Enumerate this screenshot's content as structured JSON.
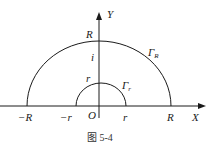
{
  "diagram": {
    "axes": {
      "x_label": "X",
      "y_label": "Y",
      "origin_label": "O"
    },
    "points": {
      "neg_R": "−R",
      "neg_r": "−r",
      "pos_r": "r",
      "pos_R": "R",
      "top_R": "R",
      "top_r": "r",
      "i": "i"
    },
    "curves": {
      "big_arc": "Γ",
      "big_arc_sub": "R",
      "small_arc": "Γ",
      "small_arc_sub": "r"
    },
    "caption": "图 5-4",
    "colors": {
      "stroke": "#1a1a1a",
      "background": "#ffffff"
    }
  }
}
